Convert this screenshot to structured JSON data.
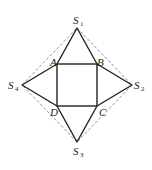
{
  "diagram": {
    "square": {
      "A": {
        "label": "A",
        "x": 57,
        "y": 64
      },
      "B": {
        "label": "B",
        "x": 97,
        "y": 64
      },
      "C": {
        "label": "C",
        "x": 97,
        "y": 106
      },
      "D": {
        "label": "D",
        "x": 57,
        "y": 106
      }
    },
    "apexes": {
      "S1": {
        "label": "S",
        "sub": "1",
        "x": 77,
        "y": 28
      },
      "S2": {
        "label": "S",
        "sub": "2",
        "x": 132,
        "y": 85
      },
      "S3": {
        "label": "S",
        "sub": "3",
        "x": 77,
        "y": 142
      },
      "S4": {
        "label": "S",
        "sub": "4",
        "x": 22,
        "y": 85
      }
    },
    "colors": {
      "solid": "#222222",
      "dashed": "#777777"
    }
  }
}
